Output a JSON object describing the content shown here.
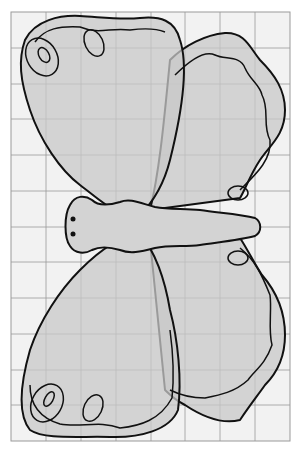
{
  "figure": {
    "grid": {
      "x0": 11,
      "y0": 12,
      "x1": 290,
      "y1": 441,
      "cols": 8,
      "rows": 12,
      "cell": 35.5
    },
    "colors": {
      "background": "#ffffff",
      "grid_bg": "#f2f2f2",
      "grid_line": "#9a9a9a",
      "wing_fill": "#d3d3d3",
      "outline": "#111111"
    }
  }
}
